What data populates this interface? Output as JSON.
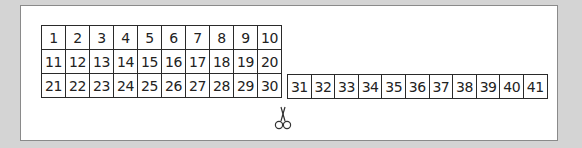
{
  "number_grid": {
    "rows": [
      [
        "1",
        "2",
        "3",
        "4",
        "5",
        "6",
        "7",
        "8",
        "9",
        "10"
      ],
      [
        "11",
        "12",
        "13",
        "14",
        "15",
        "16",
        "17",
        "18",
        "19",
        "20"
      ],
      [
        "21",
        "22",
        "23",
        "24",
        "25",
        "26",
        "27",
        "28",
        "29",
        "30"
      ]
    ]
  },
  "number_strip": {
    "cells": [
      "31",
      "32",
      "33",
      "34",
      "35",
      "36",
      "37",
      "38",
      "39",
      "40",
      "41"
    ]
  },
  "icons": {
    "cut_marker": "scissors-icon"
  },
  "colors": {
    "background": "#d4d4d4",
    "panel": "#ffffff",
    "grid_line": "#2a2a2a",
    "text": "#222222"
  }
}
